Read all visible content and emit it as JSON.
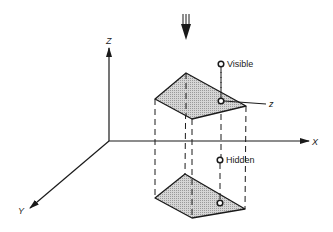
{
  "diagram": {
    "axes": {
      "x_label": "X",
      "y_label": "Y",
      "z_label": "Z"
    },
    "points": {
      "visible_label": "Visible",
      "hidden_label": "Hidden",
      "z_marker_label": "z"
    },
    "view_direction_icon": "triple-line-down-arrow",
    "colors": {
      "stroke": "#1a1a1a",
      "face_fill": "#c9c9c9",
      "background": "#ffffff"
    },
    "shapes": {
      "top_face": [
        [
          186,
          73
        ],
        [
          155,
          99
        ],
        [
          192,
          119
        ],
        [
          246,
          106
        ]
      ],
      "bottom_face": [
        [
          185,
          174
        ],
        [
          155,
          198
        ],
        [
          192,
          218
        ],
        [
          245,
          209
        ]
      ]
    }
  }
}
